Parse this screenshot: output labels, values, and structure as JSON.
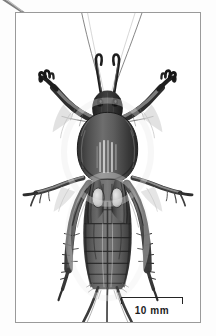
{
  "figure": {
    "view": "dorsal",
    "rendering": "grayscale scientific illustration",
    "background_color": "#ffffff",
    "frame_color": "#9a9a9a",
    "ink_color": "#1c1c1c"
  },
  "scale_bar": {
    "label": "10 mm",
    "value": 10,
    "unit": "mm",
    "style": "bracket",
    "color": "#242424",
    "position": "bottom-right"
  },
  "artifacts": {
    "corner_scratch": "diagonal scratch top-left outside frame"
  },
  "anatomy": {
    "antennae": "two long filamentous antennae in a wide V",
    "palps": "two short dark maxillary palps",
    "head": "dark rounded head capsule",
    "pronotum": "large dark oval shield",
    "forelegs": "enlarged claw-like fossorial digging legs",
    "midlegs": "slender legs extended laterally",
    "hindlegs": "long legs folded alongside abdomen",
    "wings": "short tegmina with pale oval bases",
    "abdomen": "segmented banded abdomen",
    "cerci": "two long tapering cerci"
  }
}
